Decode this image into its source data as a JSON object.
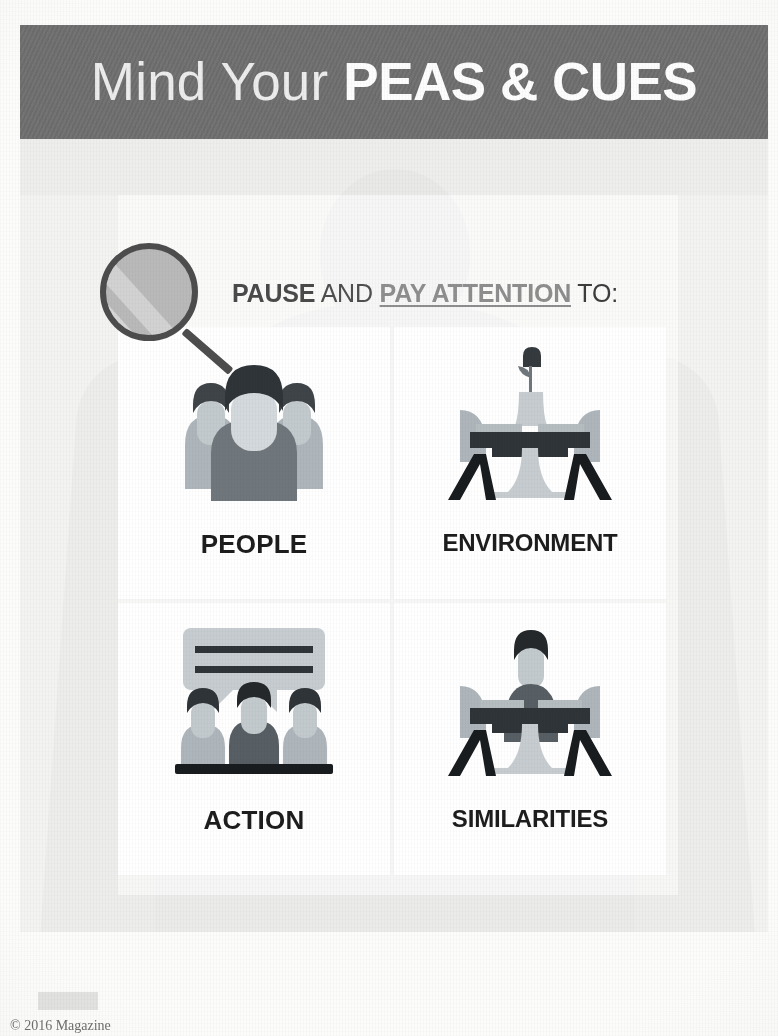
{
  "header": {
    "title_light": "Mind Your ",
    "title_bold": "PEAS & CUES"
  },
  "instruction": {
    "pause": "PAUSE",
    "and": " AND ",
    "pay_attention": "PAY ATTENTION",
    "to": " TO:"
  },
  "magnifier": {
    "icon": "magnifying-glass-icon"
  },
  "grid": {
    "panels": [
      {
        "label": "PEOPLE",
        "icon": "people-group-icon"
      },
      {
        "label": "ENVIRONMENT",
        "icon": "table-chairs-vase-icon"
      },
      {
        "label": "ACTION",
        "icon": "people-speech-bubble-icon"
      },
      {
        "label": "SIMILARITIES",
        "icon": "person-at-table-icon"
      }
    ]
  },
  "footer": {
    "copyright": "© 2016 Magazine"
  },
  "colors": {
    "header_bar": "#6f6f6f",
    "card": "#f3f3f2",
    "panel": "#ffffff",
    "label_text": "#1d1d1d",
    "accent_underline": "#8e8e8e",
    "icon_dark": "#3f4448",
    "icon_mid": "#7d868c",
    "icon_light": "#b9c0c4"
  }
}
